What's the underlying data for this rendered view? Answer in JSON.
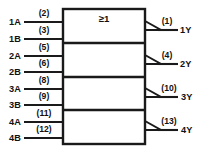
{
  "diagram": {
    "qualifying_symbol": "≥1",
    "ink_color": "#1a1a1a",
    "background_color": "#ffffff",
    "inputs": [
      {
        "name": "1A",
        "pin": "(2)",
        "y": 22
      },
      {
        "name": "1B",
        "pin": "(3)",
        "y": 39
      },
      {
        "name": "2A",
        "pin": "(5)",
        "y": 56
      },
      {
        "name": "2B",
        "pin": "(6)",
        "y": 72
      },
      {
        "name": "3A",
        "pin": "(8)",
        "y": 89
      },
      {
        "name": "3B",
        "pin": "(9)",
        "y": 105
      },
      {
        "name": "4A",
        "pin": "(11)",
        "y": 122
      },
      {
        "name": "4B",
        "pin": "(12)",
        "y": 138
      }
    ],
    "outputs": [
      {
        "name": "1Y",
        "pin": "(1)",
        "y": 30
      },
      {
        "name": "2Y",
        "pin": "(4)",
        "y": 64
      },
      {
        "name": "3Y",
        "pin": "(10)",
        "y": 97
      },
      {
        "name": "4Y",
        "pin": "(13)",
        "y": 130
      }
    ],
    "sections": [
      {
        "label": "gate-1",
        "top": 9,
        "bottom": 43
      },
      {
        "label": "gate-2",
        "top": 43,
        "bottom": 77
      },
      {
        "label": "gate-3",
        "top": 77,
        "bottom": 110
      },
      {
        "label": "gate-4",
        "top": 110,
        "bottom": 144
      }
    ],
    "box": {
      "left": 63,
      "right": 145,
      "top": 9,
      "bottom": 144
    }
  }
}
